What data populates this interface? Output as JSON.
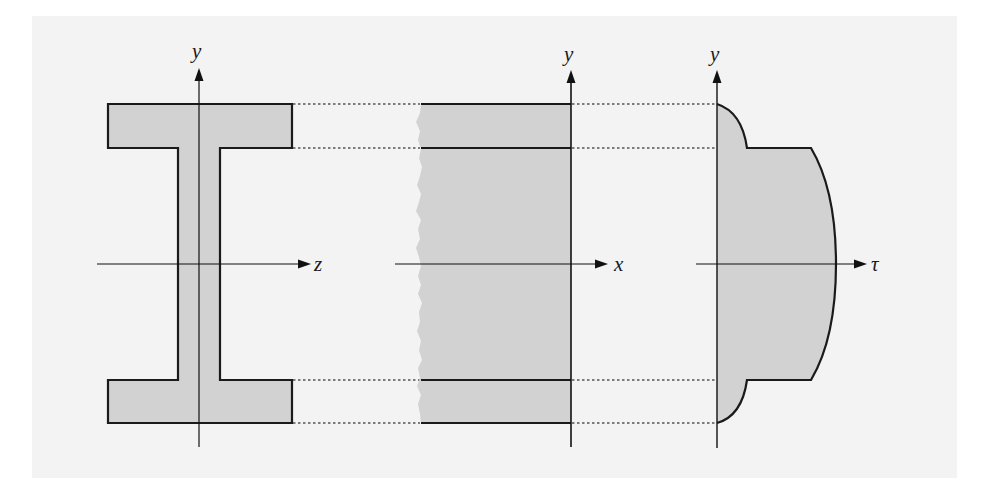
{
  "figure": {
    "background_color": "#f3f3f3",
    "fill_color": "#d2d2d2",
    "stroke_color": "#1a1a1a",
    "dotted_color": "#555555",
    "panels": [
      {
        "id": "cross-section",
        "description": "I-beam (wide-flange) cross section",
        "axes": {
          "vertical": "y",
          "horizontal": "z"
        }
      },
      {
        "id": "side-view",
        "description": "Longitudinal side view of beam with broken (jagged) left edge",
        "axes": {
          "vertical": "y",
          "horizontal": "x"
        }
      },
      {
        "id": "shear-stress-distribution",
        "description": "Shear stress distribution over the depth: parabolic in flanges, jump at flange-web junction, parabolic maximum at neutral axis",
        "axes": {
          "vertical": "y",
          "horizontal": "τ"
        }
      }
    ]
  },
  "labels": {
    "y1": "y",
    "z": "z",
    "y2": "y",
    "x": "x",
    "y3": "y",
    "tau": "τ"
  }
}
